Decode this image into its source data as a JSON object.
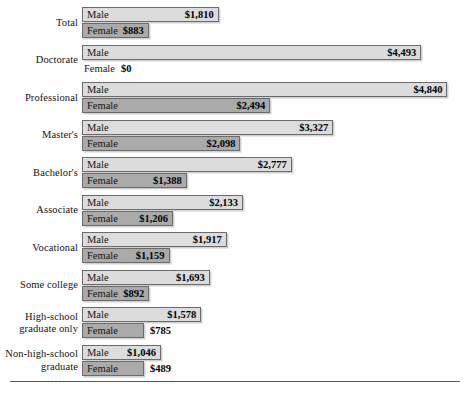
{
  "chart_data": {
    "type": "bar",
    "orientation": "horizontal",
    "title": "",
    "subtitle": "",
    "xlabel": "",
    "ylabel": "",
    "grid": false,
    "legend_position": "in-bar",
    "value_prefix": "$",
    "xlim": [
      0,
      5000
    ],
    "categories": [
      "Total",
      "Doctorate",
      "Professional",
      "Master's",
      "Bachelor's",
      "Associate",
      "Vocational",
      "Some college",
      "High-school graduate only",
      "Non-high-school graduate"
    ],
    "series": [
      {
        "name": "Male",
        "values": [
          1810,
          4493,
          4840,
          3327,
          2777,
          2133,
          1917,
          1693,
          1578,
          1046
        ]
      },
      {
        "name": "Female",
        "values": [
          883,
          0,
          2494,
          2098,
          1388,
          1206,
          1159,
          892,
          785,
          489
        ]
      }
    ],
    "value_labels": {
      "Male": [
        "$1,810",
        "$4,493",
        "$4,840",
        "$3,327",
        "$2,777",
        "$2,133",
        "$1,917",
        "$1,693",
        "$1,578",
        "$1,046"
      ],
      "Female": [
        "$883",
        "$0",
        "$2,494",
        "$2,098",
        "$1,388",
        "$1,206",
        "$1,159",
        "$892",
        "$785",
        "$489"
      ]
    },
    "colors": {
      "male_bar": "#dcdcdc",
      "female_bar": "#aaaaaa",
      "bar_border": "#6b6b6b",
      "text": "#141414",
      "rule": "#5a5a5a",
      "background": "#ffffff"
    }
  },
  "rows": [
    {
      "label_lines": [
        "Total"
      ],
      "male": {
        "name": "Male",
        "value_label": "$1,810",
        "value": 1810,
        "has_bar": true,
        "label_outside": false
      },
      "female": {
        "name": "Female",
        "value_label": "$883",
        "value": 883,
        "has_bar": true,
        "label_outside": false
      }
    },
    {
      "label_lines": [
        "Doctorate"
      ],
      "male": {
        "name": "Male",
        "value_label": "$4,493",
        "value": 4493,
        "has_bar": true,
        "label_outside": false
      },
      "female": {
        "name": "Female",
        "value_label": "$0",
        "value": 0,
        "has_bar": false,
        "label_outside": true
      }
    },
    {
      "label_lines": [
        "Professional"
      ],
      "male": {
        "name": "Male",
        "value_label": "$4,840",
        "value": 4840,
        "has_bar": true,
        "label_outside": false
      },
      "female": {
        "name": "Female",
        "value_label": "$2,494",
        "value": 2494,
        "has_bar": true,
        "label_outside": false
      }
    },
    {
      "label_lines": [
        "Master's"
      ],
      "male": {
        "name": "Male",
        "value_label": "$3,327",
        "value": 3327,
        "has_bar": true,
        "label_outside": false
      },
      "female": {
        "name": "Female",
        "value_label": "$2,098",
        "value": 2098,
        "has_bar": true,
        "label_outside": false
      }
    },
    {
      "label_lines": [
        "Bachelor's"
      ],
      "male": {
        "name": "Male",
        "value_label": "$2,777",
        "value": 2777,
        "has_bar": true,
        "label_outside": false
      },
      "female": {
        "name": "Female",
        "value_label": "$1,388",
        "value": 1388,
        "has_bar": true,
        "label_outside": false
      }
    },
    {
      "label_lines": [
        "Associate"
      ],
      "male": {
        "name": "Male",
        "value_label": "$2,133",
        "value": 2133,
        "has_bar": true,
        "label_outside": false
      },
      "female": {
        "name": "Female",
        "value_label": "$1,206",
        "value": 1206,
        "has_bar": true,
        "label_outside": false
      }
    },
    {
      "label_lines": [
        "Vocational"
      ],
      "male": {
        "name": "Male",
        "value_label": "$1,917",
        "value": 1917,
        "has_bar": true,
        "label_outside": false
      },
      "female": {
        "name": "Female",
        "value_label": "$1,159",
        "value": 1159,
        "has_bar": true,
        "label_outside": false
      }
    },
    {
      "label_lines": [
        "Some college"
      ],
      "male": {
        "name": "Male",
        "value_label": "$1,693",
        "value": 1693,
        "has_bar": true,
        "label_outside": false
      },
      "female": {
        "name": "Female",
        "value_label": "$892",
        "value": 892,
        "has_bar": true,
        "label_outside": false
      }
    },
    {
      "label_lines": [
        "High-school",
        "graduate only"
      ],
      "male": {
        "name": "Male",
        "value_label": "$1,578",
        "value": 1578,
        "has_bar": true,
        "label_outside": false
      },
      "female": {
        "name": "Female",
        "value_label": "$785",
        "value": 785,
        "has_bar": true,
        "label_outside": true
      }
    },
    {
      "label_lines": [
        "Non-high-school",
        "graduate"
      ],
      "male": {
        "name": "Male",
        "value_label": "$1,046",
        "value": 1046,
        "has_bar": true,
        "label_outside": false
      },
      "female": {
        "name": "Female",
        "value_label": "$489",
        "value": 489,
        "has_bar": true,
        "label_outside": true
      }
    }
  ],
  "layout": {
    "bar_origin_x": 82,
    "row_top_first": 6,
    "row_pitch": 37.5,
    "px_per_dollar": 0.0755,
    "min_bar_px": 62
  }
}
